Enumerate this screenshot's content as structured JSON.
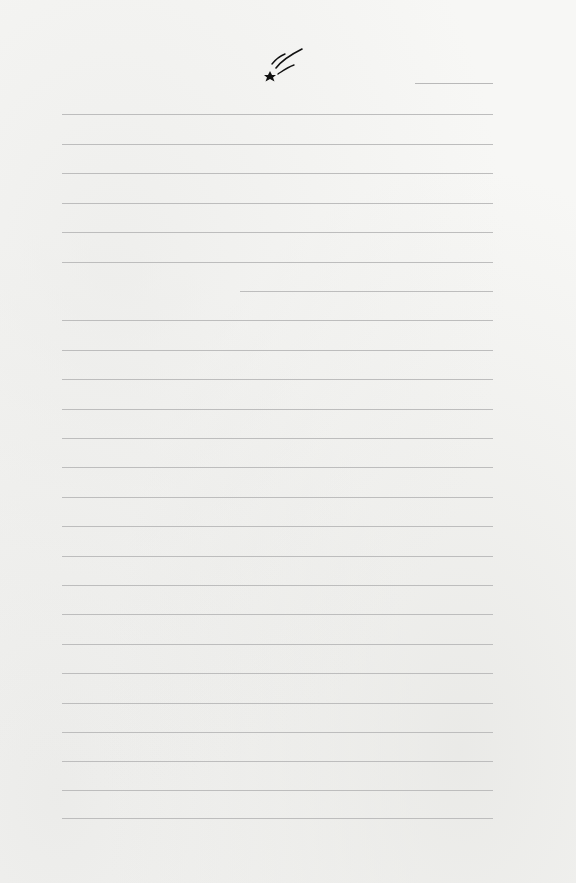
{
  "page": {
    "type": "lined-stationery",
    "decoration": "shooting-star-icon",
    "line_color": "#bdbdbd",
    "background_color": "#f7f7f5",
    "star_color": "#111111"
  },
  "date_line": {
    "x": 415,
    "y": 83,
    "width": 78
  },
  "rules": [
    {
      "y": 114,
      "x": 62,
      "width": 431
    },
    {
      "y": 144,
      "x": 62,
      "width": 431
    },
    {
      "y": 173,
      "x": 62,
      "width": 431
    },
    {
      "y": 203,
      "x": 62,
      "width": 431
    },
    {
      "y": 232,
      "x": 62,
      "width": 431
    },
    {
      "y": 262,
      "x": 62,
      "width": 431
    },
    {
      "y": 291,
      "x": 240,
      "width": 253
    },
    {
      "y": 320,
      "x": 62,
      "width": 431
    },
    {
      "y": 350,
      "x": 62,
      "width": 431
    },
    {
      "y": 379,
      "x": 62,
      "width": 431
    },
    {
      "y": 409,
      "x": 62,
      "width": 431
    },
    {
      "y": 438,
      "x": 62,
      "width": 431
    },
    {
      "y": 467,
      "x": 62,
      "width": 431
    },
    {
      "y": 497,
      "x": 62,
      "width": 431
    },
    {
      "y": 526,
      "x": 62,
      "width": 431
    },
    {
      "y": 556,
      "x": 62,
      "width": 431
    },
    {
      "y": 585,
      "x": 62,
      "width": 431
    },
    {
      "y": 614,
      "x": 62,
      "width": 431
    },
    {
      "y": 644,
      "x": 62,
      "width": 431
    },
    {
      "y": 673,
      "x": 62,
      "width": 431
    },
    {
      "y": 703,
      "x": 62,
      "width": 431
    },
    {
      "y": 732,
      "x": 62,
      "width": 431
    },
    {
      "y": 761,
      "x": 62,
      "width": 431
    },
    {
      "y": 790,
      "x": 62,
      "width": 431
    },
    {
      "y": 818,
      "x": 62,
      "width": 431
    }
  ]
}
